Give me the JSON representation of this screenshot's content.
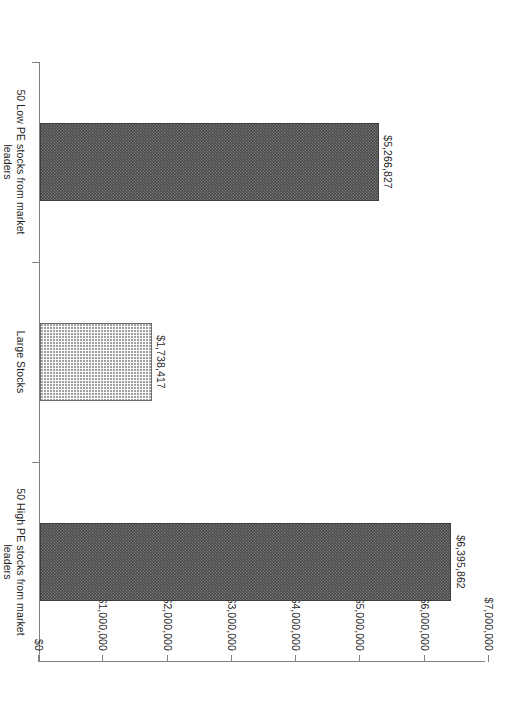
{
  "chart_data": {
    "type": "bar",
    "title": "",
    "subtitle": "",
    "xlabel": "",
    "ylabel": "",
    "orientation": "vertical-rotated-90",
    "grid": false,
    "legend": "none",
    "ylim": [
      0,
      7000000
    ],
    "ytick_step": 1000000,
    "categories": [
      "50 Low PE stocks from market leaders",
      "Large Stocks",
      "50 High PE stocks from market leaders"
    ],
    "category_lines": [
      [
        "50 Low PE stocks from market",
        "leaders"
      ],
      [
        "Large Stocks"
      ],
      [
        "50 High PE stocks from market",
        "leaders"
      ]
    ],
    "values": [
      5266827,
      1738417,
      6395862
    ],
    "value_labels": [
      "$5,266,827",
      "$1,738,417",
      "$6,395,862"
    ],
    "tick_labels": [
      "$0",
      "$1,000,000",
      "$2,000,000",
      "$3,000,000",
      "$4,000,000",
      "$5,000,000",
      "$6,000,000",
      "$7,000,000"
    ],
    "tick_values": [
      0,
      1000000,
      2000000,
      3000000,
      4000000,
      5000000,
      6000000,
      7000000
    ],
    "series": [
      {
        "name": "Ending value",
        "values": [
          5266827,
          1738417,
          6395862
        ],
        "fills": [
          "dark-checker",
          "light-dot",
          "dark-checker"
        ]
      }
    ],
    "colors": {
      "bar_dark": "#4a4a4a",
      "bar_light": "#fbfbfb",
      "bar_border": "#3d3d3d",
      "axis": "#808080",
      "text": "#1f1f1f",
      "background": "#ffffff"
    }
  }
}
